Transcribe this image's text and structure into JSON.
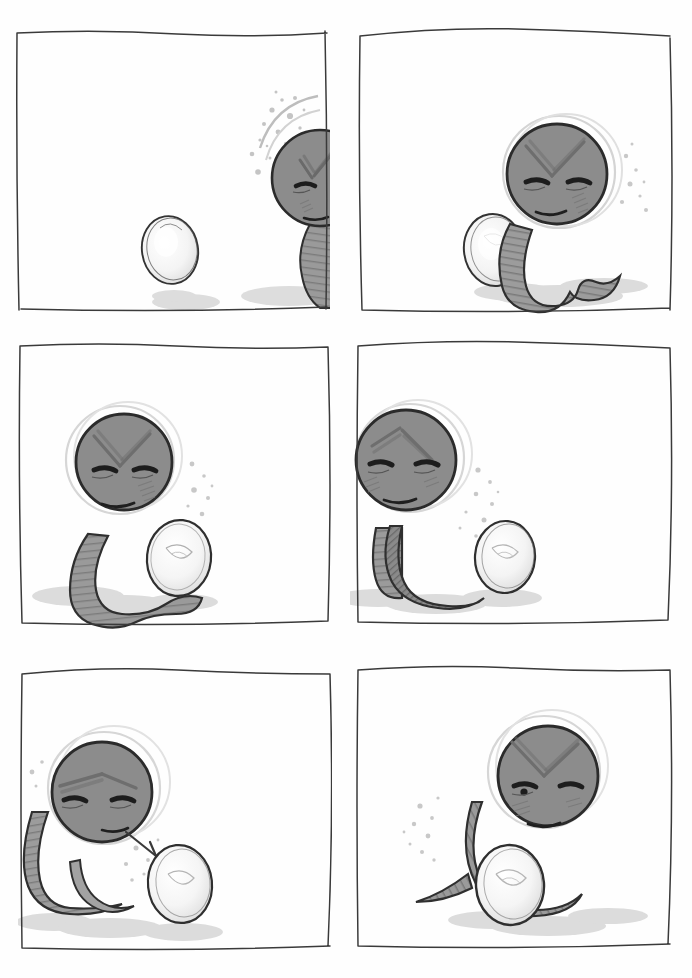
{
  "page": {
    "medium": "pencil sketch comic strip",
    "background_color": "#fefefe",
    "width": 692,
    "height": 978,
    "grid": {
      "columns": 2,
      "rows": 3,
      "panel_count": 6
    }
  },
  "palette": {
    "ink": "#2b2b2b",
    "ink_light": "#6e6e6e",
    "body_gray": "#8c8c8c",
    "body_gray_dark": "#6f6f6f",
    "body_gray_light": "#a6a6a6",
    "egg_white": "#fbfbfb",
    "egg_shade": "#e4e4e4",
    "shadow_gray": "#d9d9d9",
    "speckle_gray": "#c9c9c9",
    "border": "#3a3a3a",
    "paper": "#fefefe"
  },
  "characters": {
    "snake": {
      "name": "snake",
      "expression": "angry-frown",
      "features": [
        "v-shaped-brow",
        "narrow-eyes",
        "frowning-mouth",
        "blush-hatching",
        "striped-body",
        "forked-tongue"
      ]
    },
    "egg": {
      "name": "egg",
      "shape": "oval",
      "shading": "concentric-spiral"
    }
  },
  "panels": [
    {
      "index": 1,
      "label": "panel-1",
      "caption": "",
      "description": "Egg sits alone at left; angry snake head enters from the right edge with motion speckles",
      "x": 14,
      "y": 28,
      "w": 316,
      "h": 286,
      "snake": {
        "present": true,
        "position": "right-edge-partial",
        "head_cx": 300,
        "head_cy": 150,
        "head_r": 46
      },
      "egg": {
        "present": true,
        "cx": 168,
        "cy": 248,
        "rx": 28,
        "ry": 34
      },
      "speckles": "upper-left-of-head"
    },
    {
      "index": 2,
      "label": "panel-2",
      "caption": "",
      "description": "Full snake revealed at right with curled tail, facing the egg on the left",
      "x": 354,
      "y": 24,
      "w": 322,
      "h": 292,
      "snake": {
        "present": true,
        "position": "right",
        "head_cx": 562,
        "head_cy": 155,
        "head_r": 52
      },
      "egg": {
        "present": true,
        "cx": 494,
        "cy": 245,
        "rx": 28,
        "ry": 35
      },
      "speckles": "right-of-head"
    },
    {
      "index": 3,
      "label": "panel-3",
      "caption": "",
      "description": "Snake at left leans over; egg now close beside its coiled tail",
      "x": 16,
      "y": 340,
      "w": 316,
      "h": 290,
      "snake": {
        "present": true,
        "position": "left",
        "head_cx": 120,
        "head_cy": 462,
        "head_r": 50
      },
      "egg": {
        "present": true,
        "cx": 175,
        "cy": 560,
        "rx": 29,
        "ry": 35
      },
      "speckles": "right-of-head"
    },
    {
      "index": 4,
      "label": "panel-4",
      "caption": "",
      "description": "Snake pushed to far left with long tail; the egg has moved away to the right",
      "x": 350,
      "y": 336,
      "w": 326,
      "h": 294,
      "snake": {
        "present": true,
        "position": "far-left",
        "head_cx": 406,
        "head_cy": 465,
        "head_r": 52
      },
      "egg": {
        "present": true,
        "cx": 505,
        "cy": 557,
        "rx": 28,
        "ry": 35
      },
      "speckles": "right-of-head"
    },
    {
      "index": 5,
      "label": "panel-5",
      "caption": "",
      "description": "Snake flicks its forked tongue out toward the egg at right",
      "x": 18,
      "y": 664,
      "w": 314,
      "h": 292,
      "snake": {
        "present": true,
        "position": "left",
        "head_cx": 95,
        "head_cy": 795,
        "head_r": 50
      },
      "egg": {
        "present": true,
        "cx": 180,
        "cy": 880,
        "rx": 30,
        "ry": 37
      },
      "tongue": true,
      "speckles": "left-and-below-head"
    },
    {
      "index": 6,
      "label": "panel-6",
      "caption": "",
      "description": "Snake coils its body protectively around the egg, still scowling",
      "x": 352,
      "y": 660,
      "w": 324,
      "h": 296,
      "snake": {
        "present": true,
        "position": "center-right",
        "head_cx": 546,
        "head_cy": 778,
        "head_r": 52
      },
      "egg": {
        "present": true,
        "cx": 510,
        "cy": 885,
        "rx": 32,
        "ry": 38
      },
      "speckles": "left-of-head"
    }
  ]
}
